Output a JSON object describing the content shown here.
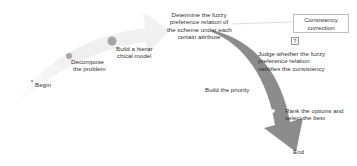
{
  "diagram": {
    "type": "process-flow-arrows",
    "colors": {
      "light_arrow": "#eeeeee",
      "dark_arrow": "#8c8c8c",
      "step_dot": "#a6a6a6",
      "connector": "#bfbfbf",
      "text": "#333333"
    },
    "steps": [
      {
        "id": "begin",
        "label": "Begin"
      },
      {
        "id": "decompose",
        "label_lines": [
          "Decompose",
          "the problem"
        ]
      },
      {
        "id": "hierarchical",
        "label_lines": [
          "Build a hierar",
          "chical model"
        ]
      },
      {
        "id": "fuzzy",
        "label_lines": [
          "Determine the fuzzy",
          "preference relation of",
          "the scheme under each",
          "certain attribute"
        ]
      },
      {
        "id": "judge",
        "label_lines": [
          "Judge whether the fuzzy",
          "preference relation",
          "satisfies the consistency"
        ]
      },
      {
        "id": "priority",
        "label": "Build the priority"
      },
      {
        "id": "rank",
        "label_lines": [
          "Rank the options and",
          "select the best"
        ]
      },
      {
        "id": "end",
        "label": "End"
      }
    ],
    "correction_box": {
      "label_lines": [
        "Consistency",
        "correction"
      ]
    },
    "marker_glyph": "?"
  }
}
